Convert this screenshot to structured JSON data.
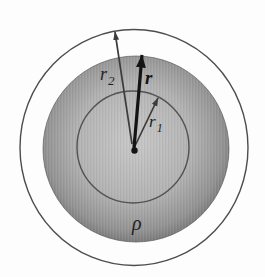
{
  "figure": {
    "labels": {
      "r2": {
        "base": "r",
        "sub": "2"
      },
      "r": "r",
      "r1": {
        "base": "r",
        "sub": "1"
      },
      "rho": "ρ"
    },
    "colors": {
      "background": "#fdfdfd",
      "outline": "#4d4d4d",
      "inner_circle": "#525252",
      "sphere_light": "#c8c8c8",
      "sphere_mid": "#b3b3b3",
      "sphere_dark": "#949494",
      "sphere_rim": "#757575",
      "arrow_thin": "#3c3c3c",
      "arrow_bold": "#141414",
      "label": "#222222"
    }
  }
}
